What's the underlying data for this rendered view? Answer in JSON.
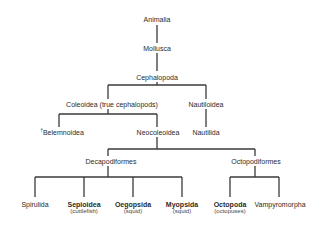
{
  "diagram": {
    "type": "taxonomy-tree",
    "line_color": "#3a3a3a",
    "nodes": {
      "animalia": "Animalia",
      "mollusca": "Mollusca",
      "cephalopoda": "Cephalopoda",
      "coleoidea": "Coleoidea (true cephalopods)",
      "nautiloidea": "Nautiloidea",
      "belemnoidea_mark": "†",
      "belemnoidea": "Belemnoidea",
      "neocoleoidea": "Neocoleoidea",
      "nautilida": "Nautilida",
      "decapodiformes": "Decapodiformes",
      "octopodiformes": "Octopodiformes",
      "spirulida": "Spirulida",
      "sepioidea": "Sepioidea",
      "sepioidea_common": "(cuttlefish)",
      "oegopsida": "Oegopsida",
      "oegopsida_common": "(squid)",
      "myopsida": "Myopsida",
      "myopsida_common": "(squid)",
      "octopoda": "Octopoda",
      "octopoda_common": "(octopuses)",
      "vampyromorpha": "Vampyromorpha"
    },
    "edges": [
      [
        "Animalia",
        "Mollusca"
      ],
      [
        "Mollusca",
        "Cephalopoda"
      ],
      [
        "Cephalopoda",
        "Coleoidea (true cephalopods)"
      ],
      [
        "Cephalopoda",
        "Nautiloidea"
      ],
      [
        "Coleoidea (true cephalopods)",
        "Belemnoidea"
      ],
      [
        "Coleoidea (true cephalopods)",
        "Neocoleoidea"
      ],
      [
        "Nautiloidea",
        "Nautilida"
      ],
      [
        "Neocoleoidea",
        "Decapodiformes"
      ],
      [
        "Neocoleoidea",
        "Octopodiformes"
      ],
      [
        "Decapodiformes",
        "Spirulida"
      ],
      [
        "Decapodiformes",
        "Sepioidea"
      ],
      [
        "Decapodiformes",
        "Oegopsida"
      ],
      [
        "Decapodiformes",
        "Myopsida"
      ],
      [
        "Octopodiformes",
        "Octopoda"
      ],
      [
        "Octopodiformes",
        "Vampyromorpha"
      ]
    ]
  }
}
